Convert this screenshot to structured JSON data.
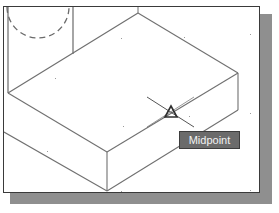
{
  "viewport": {
    "background": "#ffffff",
    "border_color": "#3a3a3a",
    "shadow_color": "#8f8f8f"
  },
  "drawing": {
    "line_color": "#6f6f6f",
    "model": "isometric box",
    "dashed_arc": {
      "cx": 34,
      "cy": 0,
      "r": 33
    }
  },
  "snap_marker": {
    "type": "midpoint",
    "icon": "triangle-icon",
    "x": 167,
    "y": 106
  },
  "tooltip": {
    "label": "Midpoint",
    "background": "#6b6b6b",
    "text_color": "#f2f2f2"
  }
}
